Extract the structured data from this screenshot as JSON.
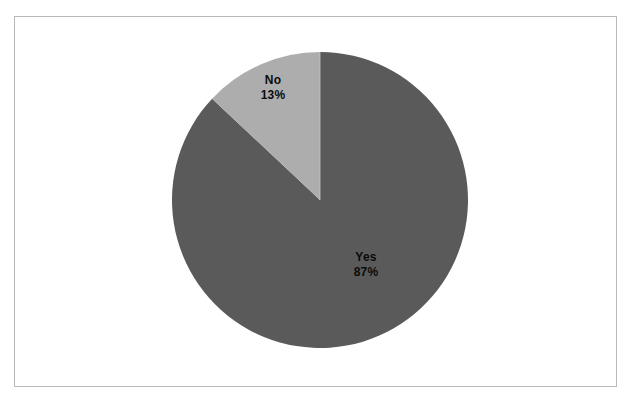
{
  "page": {
    "background_color": "#ffffff",
    "frame_border_color": "#b9b9bd"
  },
  "chart_data": {
    "type": "pie",
    "title": "",
    "subtitle": "",
    "xlabel": "",
    "ylabel": "",
    "legend_position": "none",
    "grid": false,
    "labels_inside_slices": true,
    "start_angle_deg": 0,
    "direction": "clockwise",
    "categories": [
      "Yes",
      "No"
    ],
    "values": [
      87,
      13
    ],
    "value_unit": "%",
    "colors": [
      "#5a5a5a",
      "#adadad"
    ],
    "slices": [
      {
        "name": "Yes",
        "value": 87,
        "label_name": "Yes",
        "label_value": "87%",
        "color": "#5a5a5a",
        "start_angle_deg": 0,
        "end_angle_deg": 313.2
      },
      {
        "name": "No",
        "value": 13,
        "label_name": "No",
        "label_value": "13%",
        "color": "#adadad",
        "start_angle_deg": 313.2,
        "end_angle_deg": 360
      }
    ],
    "geometry": {
      "center_x": 320,
      "center_y": 200,
      "radius": 148
    }
  }
}
